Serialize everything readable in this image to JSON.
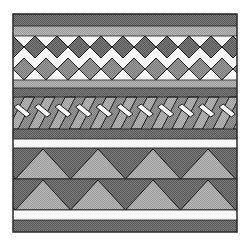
{
  "figure": {
    "kind": "decorative-border-pattern",
    "background": "#ffffff",
    "frame": {
      "x": 13,
      "y": 14,
      "width": 224,
      "height": 218,
      "stroke": "#2a2a2a"
    },
    "colors": {
      "dark": "#6e6e6e",
      "mid": "#8e8e8e",
      "light": "#a9a9a9",
      "white": "#f7f7f7",
      "line": "#1e1e1e"
    },
    "bands": [
      {
        "name": "top-dark-band",
        "y": 14,
        "h": 12,
        "fill": "dark"
      },
      {
        "name": "top-light-band",
        "y": 26,
        "h": 10,
        "fill": "light"
      },
      {
        "name": "diamond-band",
        "y": 36,
        "h": 44,
        "pattern": "diamonds",
        "period": 22,
        "rows": 2
      },
      {
        "name": "mid-light-band",
        "y": 80,
        "h": 8,
        "fill": "light"
      },
      {
        "name": "mid-dark-band",
        "y": 88,
        "h": 9,
        "fill": "dark"
      },
      {
        "name": "braid-band",
        "y": 97,
        "h": 32,
        "pattern": "braid",
        "period": 20.5
      },
      {
        "name": "lower-dark-band",
        "y": 129,
        "h": 10,
        "fill": "dark"
      },
      {
        "name": "white-stripe-1",
        "y": 139,
        "h": 9,
        "fill": "white"
      },
      {
        "name": "triangle-band-top",
        "y": 148,
        "h": 31,
        "pattern": "triangles",
        "period": 55,
        "peak_offset": 30
      },
      {
        "name": "triangle-band-bottom",
        "y": 179,
        "h": 31,
        "pattern": "triangles",
        "period": 55,
        "peak_offset": 30
      },
      {
        "name": "white-stripe-2",
        "y": 210,
        "h": 10,
        "fill": "white"
      },
      {
        "name": "bottom-dark-band",
        "y": 220,
        "h": 12,
        "fill": "dark"
      }
    ]
  }
}
